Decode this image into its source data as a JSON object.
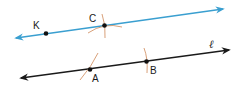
{
  "diagram": {
    "title": "",
    "colors": {
      "parallel_line": "#3a9fd0",
      "line_l": "#1a1a1a",
      "arcs": "#d4956a",
      "points": "#111111"
    },
    "lines": [
      {
        "id": "line-kc",
        "through": [
          "K",
          "C"
        ],
        "color": "#3a9fd0",
        "arrows": "both"
      },
      {
        "id": "line-l",
        "name": "ℓ",
        "through": [
          "A",
          "B"
        ],
        "color": "#1a1a1a",
        "arrows": "both"
      }
    ],
    "points": {
      "K": {
        "label": "K"
      },
      "C": {
        "label": "C"
      },
      "A": {
        "label": "A"
      },
      "B": {
        "label": "B"
      }
    },
    "line_label": "ℓ",
    "construction_arcs": [
      "arc at C (two crossing arcs)",
      "arc at A",
      "arc at B"
    ]
  }
}
